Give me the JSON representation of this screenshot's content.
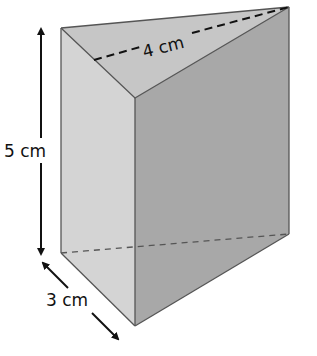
{
  "figure": {
    "type": "triangular-prism",
    "labels": {
      "height": "5 cm",
      "base_side": "3 cm",
      "top_edge": "4 cm"
    },
    "colors": {
      "top_face": "#c9c9c9",
      "left_face": "#d3d3d3",
      "right_face": "#a9a9a9",
      "edge": "#555555",
      "arrow": "#111111"
    }
  }
}
